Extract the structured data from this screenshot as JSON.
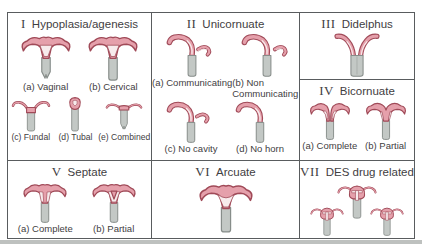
{
  "colors": {
    "background": "#ffffff",
    "line": "#595c5e",
    "text": "#3f4042",
    "pink_fill": "#e5a0ab",
    "pink_outline": "#a04a58",
    "cavity": "#f7ebec",
    "gray_fill": "#c3c8c5",
    "gray_outline": "#878d8a",
    "scan_shadow": "#aeb1af"
  },
  "panels": [
    {
      "numeral": "I",
      "title": "Hypoplasia/agenesis",
      "items": [
        {
          "label": "(a) Vaginal",
          "figure": "uterus-vaginal-agenesis"
        },
        {
          "label": "(b) Cervical",
          "figure": "uterus-cervical-agenesis"
        },
        {
          "label": "(c) Fundal",
          "figure": "uterus-fundal-agenesis"
        },
        {
          "label": "(d) Tubal",
          "figure": "uterus-tubal-agenesis"
        },
        {
          "label": "(e) Combined",
          "figure": "uterus-combined-agenesis"
        }
      ]
    },
    {
      "numeral": "II",
      "title": "Unicornuate",
      "items": [
        {
          "label": "(a) Communicating",
          "figure": "uterus-unicornuate-communicating"
        },
        {
          "label": "(b) Non Communicating",
          "figure": "uterus-unicornuate-non-communicating"
        },
        {
          "label": "(c) No cavity",
          "figure": "uterus-unicornuate-no-cavity"
        },
        {
          "label": "(d) No horn",
          "figure": "uterus-unicornuate-no-horn"
        }
      ]
    },
    {
      "numeral": "III",
      "title": "Didelphus",
      "items": [
        {
          "figure": "uterus-didelphus"
        }
      ]
    },
    {
      "numeral": "IV",
      "title": "Bicornuate",
      "items": [
        {
          "label": "(a) Complete",
          "figure": "uterus-bicornuate-complete"
        },
        {
          "label": "(b) Partial",
          "figure": "uterus-bicornuate-partial"
        }
      ]
    },
    {
      "numeral": "V",
      "title": "Septate",
      "items": [
        {
          "label": "(a) Complete",
          "figure": "uterus-septate-complete"
        },
        {
          "label": "(b) Partial",
          "figure": "uterus-septate-partial"
        }
      ]
    },
    {
      "numeral": "VI",
      "title": "Arcuate",
      "items": [
        {
          "figure": "uterus-arcuate"
        }
      ]
    },
    {
      "numeral": "VII",
      "title": "DES drug related",
      "items": [
        {
          "figure": "uterus-des-t-shaped-center"
        },
        {
          "figure": "uterus-des-t-shaped-left"
        },
        {
          "figure": "uterus-des-t-shaped-right"
        }
      ]
    }
  ]
}
